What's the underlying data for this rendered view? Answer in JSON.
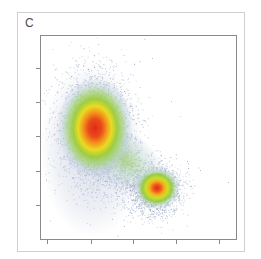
{
  "panel": {
    "label": "C"
  },
  "chart_data": {
    "type": "scatter",
    "subtype": "density-colored flow cytometry scatter",
    "title": "",
    "xlabel": "",
    "ylabel": "",
    "x_tick_labels": [
      "",
      "",
      "",
      "",
      ""
    ],
    "y_tick_labels": [
      "",
      "",
      "",
      "",
      ""
    ],
    "grid": false,
    "legend": null,
    "color_scale": [
      "#a9b3cf",
      "#b9d9d6",
      "#8cc63f",
      "#d6e21d",
      "#f5c518",
      "#f08a1c",
      "#e8301a"
    ],
    "clusters": [
      {
        "name": "population-1",
        "center_x_frac": 0.28,
        "center_y_frac": 0.45,
        "spread_x_frac": 0.13,
        "spread_y_frac": 0.19,
        "relative_density": 1.0
      },
      {
        "name": "population-2",
        "center_x_frac": 0.59,
        "center_y_frac": 0.75,
        "spread_x_frac": 0.09,
        "spread_y_frac": 0.08,
        "relative_density": 0.55
      }
    ]
  },
  "plot": {
    "x": 40,
    "y": 35,
    "w": 197,
    "h": 205,
    "frame_color": "#8a8a8a",
    "x_ticks": [
      47,
      91,
      133,
      176,
      219
    ],
    "y_ticks": [
      68,
      102,
      136,
      171,
      205
    ]
  }
}
